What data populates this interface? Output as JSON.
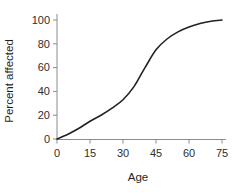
{
  "figure": {
    "background": "#ffffff"
  },
  "chart_data": {
    "type": "line",
    "title": "",
    "xlabel": "Age",
    "ylabel": "Percent affected",
    "x": [
      0,
      5,
      10,
      15,
      20,
      25,
      30,
      35,
      40,
      45,
      50,
      55,
      60,
      65,
      70,
      75
    ],
    "y": [
      0,
      4,
      9,
      15,
      20,
      26,
      33,
      44,
      60,
      75,
      84,
      90,
      94,
      97,
      99,
      100
    ],
    "xlim": [
      0,
      75
    ],
    "ylim": [
      0,
      100
    ],
    "xticks": [
      0,
      15,
      30,
      45,
      60,
      75
    ],
    "yticks": [
      0,
      20,
      40,
      60,
      80,
      100
    ],
    "grid": false,
    "legend": null,
    "line_color": "#222222",
    "axis_color": "#8c8c8c",
    "tick_label_color": "#2e2e2e",
    "axis_label_color": "#1f1f1f"
  }
}
